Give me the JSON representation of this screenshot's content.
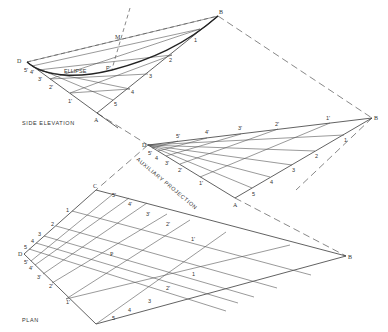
{
  "views": {
    "side_elevation": {
      "title": "SIDE ELEVATION",
      "curve_label": "ELLIPSE",
      "vertices": {
        "D": "D",
        "A": "A",
        "B": "B",
        "M": "M",
        "P": "P'"
      },
      "edge_labels_DA": [
        "5'",
        "4'",
        "3'",
        "2'",
        "1'"
      ],
      "edge_labels_AB": [
        "5",
        "4",
        "3",
        "2",
        "1"
      ]
    },
    "auxiliary_projection": {
      "title": "AUXILIARY PROJECTION",
      "vertices": {
        "D": "D",
        "A": "A",
        "B": "B"
      },
      "edge_labels_DA": [
        "5'",
        "4",
        "3'",
        "2'",
        "1'"
      ],
      "edge_labels_AB": [
        "5",
        "4",
        "3",
        "2",
        "1"
      ],
      "edge_labels_DB": [
        "5'",
        "4'",
        "3'",
        "2'",
        "1'"
      ]
    },
    "plan": {
      "title": "PLAN",
      "vertices": {
        "C": "C",
        "D": "D",
        "B": "B",
        "A": "A",
        "P": "P"
      },
      "edge_labels_CD": [
        "1",
        "2",
        "3",
        "4",
        "5"
      ],
      "edge_labels_CB": [
        "5'",
        "4'",
        "3'",
        "2'",
        "1'"
      ],
      "edge_labels_DA": [
        "5'",
        "4'",
        "3'",
        "2'",
        "1'"
      ],
      "edge_labels_AB": [
        "5",
        "4",
        "3",
        "2'",
        "1"
      ]
    }
  }
}
